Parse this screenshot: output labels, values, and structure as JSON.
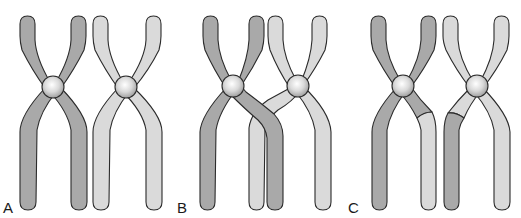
{
  "figure": {
    "colors": {
      "dark_chromatid": "#a9a9a9",
      "light_chromatid": "#dadada",
      "outline": "#2b2b2b",
      "centromere_highlight": "#ffffff",
      "centromere_shade": "#a0a0a0",
      "background": "#ffffff"
    },
    "panels": [
      {
        "label": "A",
        "stage": "homologous-pair"
      },
      {
        "label": "B",
        "stage": "crossing-over"
      },
      {
        "label": "C",
        "stage": "recombinant-chromatids"
      }
    ]
  }
}
